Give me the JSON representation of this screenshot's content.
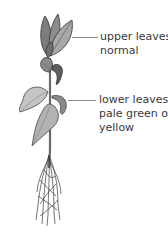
{
  "diagram": {
    "labels": [
      {
        "id": "upper",
        "lines": [
          "upper leaves",
          "normal"
        ]
      },
      {
        "id": "lower",
        "lines": [
          "lower leaves",
          "pale green or",
          "yellow"
        ]
      }
    ],
    "colors": {
      "leaf_fill": "#9a9a9a",
      "leaf_dark": "#5e5e5e",
      "leaf_light": "#c4c4c4",
      "outline": "#333333",
      "stem": "#6a6a6a",
      "leader": "#8a8a8a",
      "text": "#3a3a3a"
    }
  }
}
